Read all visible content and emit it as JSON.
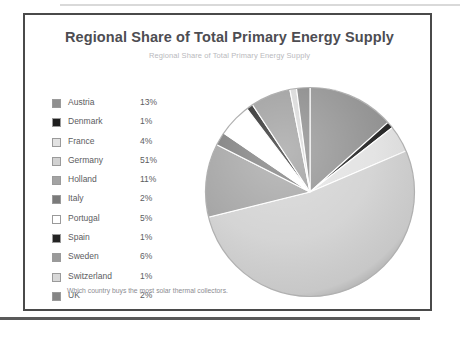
{
  "chart_data": {
    "type": "pie",
    "title": "Regional Share of Total Primary Energy Supply",
    "subtitle": "Regional Share of Total Primary Energy Supply",
    "caption": "Which country buys the most solar thermal collectors.",
    "xlabel": "",
    "ylabel": "",
    "legend_position": "left",
    "start_angle_deg": 0,
    "direction": "clockwise",
    "categories": [
      "Austria",
      "Denmark",
      "France",
      "Germany",
      "Holland",
      "Italy",
      "Portugal",
      "Spain",
      "Sweden",
      "Switzerland",
      "UK"
    ],
    "values": [
      13,
      1,
      4,
      51,
      11,
      2,
      5,
      1,
      6,
      1,
      2
    ],
    "value_labels": [
      "13%",
      "1%",
      "4%",
      "51%",
      "11%",
      "2%",
      "5%",
      "1%",
      "6%",
      "1%",
      "2%"
    ],
    "unit": "%",
    "colors": [
      "#8f8f8f",
      "#1f1f1f",
      "#e2e2e2",
      "#d2d2d2",
      "#a3a3a3",
      "#7a7a7a",
      "#ffffff",
      "#232323",
      "#9a9a9a",
      "#d8d8d8",
      "#858585"
    ],
    "slices": [
      {
        "label": "Austria",
        "value": 13,
        "value_label": "13%",
        "color": "#8f8f8f"
      },
      {
        "label": "Denmark",
        "value": 1,
        "value_label": "1%",
        "color": "#1f1f1f"
      },
      {
        "label": "France",
        "value": 4,
        "value_label": "4%",
        "color": "#e2e2e2"
      },
      {
        "label": "Germany",
        "value": 51,
        "value_label": "51%",
        "color": "#d2d2d2"
      },
      {
        "label": "Holland",
        "value": 11,
        "value_label": "11%",
        "color": "#a3a3a3"
      },
      {
        "label": "Italy",
        "value": 2,
        "value_label": "2%",
        "color": "#7a7a7a"
      },
      {
        "label": "Portugal",
        "value": 5,
        "value_label": "5%",
        "color": "#ffffff"
      },
      {
        "label": "Spain",
        "value": 1,
        "value_label": "1%",
        "color": "#232323"
      },
      {
        "label": "Sweden",
        "value": 6,
        "value_label": "6%",
        "color": "#9a9a9a"
      },
      {
        "label": "Switzerland",
        "value": 1,
        "value_label": "1%",
        "color": "#d8d8d8"
      },
      {
        "label": "UK",
        "value": 2,
        "value_label": "2%",
        "color": "#858585"
      }
    ]
  }
}
